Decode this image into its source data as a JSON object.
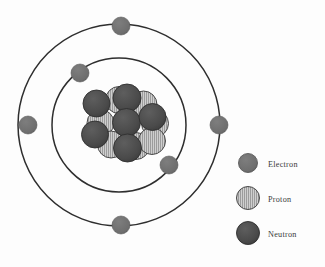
{
  "diagram": {
    "background_color": "#fdfdfd",
    "orbit_line_color": "#2e2e2e",
    "nucleus": {
      "neutron_color": "#4a4a4a",
      "proton_color": "#c9c9c9",
      "proton_hatch_color": "#8f8f8f",
      "particle_outline_color": "#3a3a3a",
      "neutron_count": 6,
      "proton_count": 7,
      "protons": [
        {
          "cx": 119.0,
          "cy": 100.0,
          "r": 13.5
        },
        {
          "cx": 143.5,
          "cy": 104.5,
          "r": 13.5
        },
        {
          "cx": 155.0,
          "cy": 123.5,
          "r": 13.5
        },
        {
          "cx": 100.5,
          "cy": 123.0,
          "r": 13.5
        },
        {
          "cx": 111.0,
          "cy": 144.5,
          "r": 13.5
        },
        {
          "cx": 136.0,
          "cy": 146.0,
          "r": 13.5
        },
        {
          "cx": 152.0,
          "cy": 141.0,
          "r": 13.5
        }
      ],
      "neutrons": [
        {
          "cx": 96.5,
          "cy": 103.5,
          "r": 13.5
        },
        {
          "cx": 127.0,
          "cy": 98.0,
          "r": 14.0
        },
        {
          "cx": 126.5,
          "cy": 122.5,
          "r": 14.0
        },
        {
          "cx": 152.5,
          "cy": 117.0,
          "r": 13.5
        },
        {
          "cx": 95.0,
          "cy": 134.5,
          "r": 13.5
        },
        {
          "cx": 127.5,
          "cy": 148.0,
          "r": 14.0
        }
      ]
    },
    "orbits": [
      {
        "name": "outer-orbit",
        "cx": 119,
        "cy": 125,
        "r": 101
      },
      {
        "name": "inner-orbit",
        "cx": 119,
        "cy": 125,
        "r": 67
      }
    ],
    "electron_color": "#6e6e6e",
    "electrons": [
      {
        "name": "electron-outer-top",
        "cx": 121,
        "cy": 26,
        "r": 9.0,
        "orbit": "outer"
      },
      {
        "name": "electron-outer-left",
        "cx": 28,
        "cy": 125,
        "r": 9.0,
        "orbit": "outer"
      },
      {
        "name": "electron-outer-right",
        "cx": 219,
        "cy": 125,
        "r": 9.0,
        "orbit": "outer"
      },
      {
        "name": "electron-outer-bottom",
        "cx": 121,
        "cy": 225,
        "r": 9.0,
        "orbit": "outer"
      },
      {
        "name": "electron-inner-upper-left",
        "cx": 80,
        "cy": 73,
        "r": 9.0,
        "orbit": "inner"
      },
      {
        "name": "electron-inner-lower-right",
        "cx": 169,
        "cy": 165,
        "r": 9.0,
        "orbit": "inner"
      }
    ]
  },
  "legend": {
    "items": [
      {
        "key": "electron",
        "label": "Electron",
        "swatch_type": "electron",
        "swatch_color": "#6e6e6e",
        "swatch": {
          "cx": 248,
          "cy": 163,
          "r": 9.5
        },
        "label_x": 268,
        "label_y": 167
      },
      {
        "key": "proton",
        "label": "Proton",
        "swatch_type": "proton",
        "swatch_color": "#c9c9c9",
        "swatch": {
          "cx": 248,
          "cy": 198,
          "r": 11.5
        },
        "label_x": 268,
        "label_y": 202
      },
      {
        "key": "neutron",
        "label": "Neutron",
        "swatch_type": "neutron",
        "swatch_color": "#4a4a4a",
        "swatch": {
          "cx": 248,
          "cy": 233,
          "r": 11.5
        },
        "label_x": 268,
        "label_y": 237
      }
    ]
  }
}
